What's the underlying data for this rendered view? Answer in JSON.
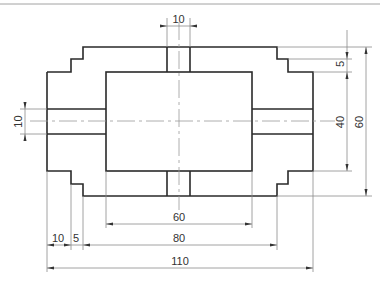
{
  "drawing": {
    "units": "mm",
    "dimensions": {
      "slot_width_top": "10",
      "step_height": "5",
      "inner_height": "40",
      "overall_height": "60",
      "slot_width_side": "10",
      "inner_width": "60",
      "step_width_1": "10",
      "step_width_2": "5",
      "middle_width": "80",
      "overall_width": "110"
    }
  }
}
